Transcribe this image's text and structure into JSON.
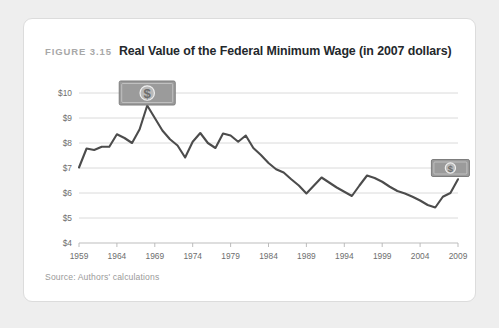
{
  "figure": {
    "label": "FIGURE 3.15",
    "title": "Real Value of the Federal Minimum Wage (in 2007 dollars)",
    "source": "Source: Authors' calculations"
  },
  "icons": {
    "dollar_bill_glyph": "$",
    "large_bill_name": "dollar-bill-icon",
    "small_bill_name": "dollar-bill-icon"
  },
  "colors": {
    "page_background": "#eeeeee",
    "card_background": "#ffffff",
    "card_border": "#dcdcdc",
    "line": "#4c4c4c",
    "grid": "#d6d6d6",
    "axis": "#b6b6b6",
    "tick_label": "#6e6e6e",
    "title": "#24282c",
    "figure_label": "#a8a8a8",
    "source": "#9a9a9a",
    "bill_icon": "#9b9b9b"
  },
  "chart_data": {
    "type": "line",
    "title": "Real Value of the Federal Minimum Wage (in 2007 dollars)",
    "xlabel": "",
    "ylabel": "",
    "xlim": [
      1959,
      2009
    ],
    "ylim": [
      4,
      10
    ],
    "grid": true,
    "legend": "none",
    "ytick_labels": [
      "$4",
      "$5",
      "$6",
      "$7",
      "$8",
      "$9",
      "$10"
    ],
    "ytick_values": [
      4,
      5,
      6,
      7,
      8,
      9,
      10
    ],
    "xtick_labels": [
      "1959",
      "1964",
      "1969",
      "1974",
      "1979",
      "1984",
      "1989",
      "1994",
      "1999",
      "2004",
      "2009"
    ],
    "xtick_values": [
      1959,
      1964,
      1969,
      1974,
      1979,
      1984,
      1989,
      1994,
      1999,
      2004,
      2009
    ],
    "series": [
      {
        "name": "Real federal minimum wage (2007 dollars)",
        "x": [
          1959,
          1960,
          1961,
          1962,
          1963,
          1964,
          1965,
          1966,
          1967,
          1968,
          1969,
          1970,
          1971,
          1972,
          1973,
          1974,
          1975,
          1976,
          1977,
          1978,
          1979,
          1980,
          1981,
          1982,
          1983,
          1984,
          1985,
          1986,
          1987,
          1988,
          1989,
          1990,
          1991,
          1992,
          1993,
          1994,
          1995,
          1996,
          1997,
          1998,
          1999,
          2000,
          2001,
          2002,
          2003,
          2004,
          2005,
          2006,
          2007,
          2008,
          2009
        ],
        "values": [
          7.02,
          7.78,
          7.72,
          7.85,
          7.85,
          8.35,
          8.2,
          8.0,
          8.55,
          9.5,
          9.0,
          8.5,
          8.15,
          7.9,
          7.42,
          8.05,
          8.4,
          8.0,
          7.8,
          8.38,
          8.3,
          8.05,
          8.3,
          7.8,
          7.52,
          7.2,
          6.95,
          6.82,
          6.55,
          6.3,
          5.98,
          6.3,
          6.62,
          6.42,
          6.22,
          6.05,
          5.88,
          6.3,
          6.7,
          6.6,
          6.45,
          6.25,
          6.08,
          5.98,
          5.85,
          5.7,
          5.52,
          5.42,
          5.85,
          6.0,
          6.55
        ]
      }
    ],
    "annotations": [
      {
        "name": "dollar-bill-icon-peak",
        "x_year": 1968,
        "y_value": 10.0,
        "depicts": "dollar bill with $ symbol"
      },
      {
        "name": "dollar-bill-icon-end",
        "x_year": 2008,
        "y_value": 7.0,
        "depicts": "dollar bill with $ symbol"
      }
    ]
  }
}
